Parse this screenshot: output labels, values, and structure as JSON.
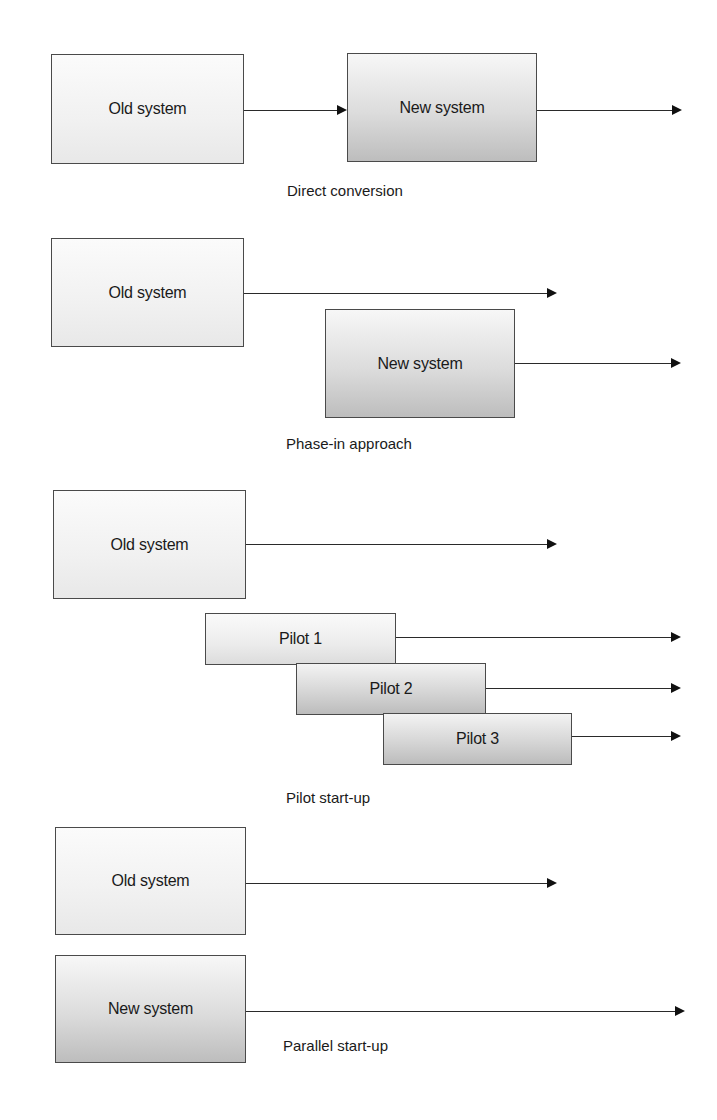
{
  "diagram": {
    "sections": [
      {
        "id": "direct-conversion",
        "caption": "Direct conversion",
        "boxes": [
          {
            "label": "Old system",
            "style": "old"
          },
          {
            "label": "New system",
            "style": "new"
          }
        ]
      },
      {
        "id": "phase-in-approach",
        "caption": "Phase-in approach",
        "boxes": [
          {
            "label": "Old system",
            "style": "old"
          },
          {
            "label": "New system",
            "style": "new"
          }
        ]
      },
      {
        "id": "pilot-start-up",
        "caption": "Pilot start-up",
        "boxes": [
          {
            "label": "Old system",
            "style": "old"
          },
          {
            "label": "Pilot 1",
            "style": "pilot-light"
          },
          {
            "label": "Pilot 2",
            "style": "pilot-dark"
          },
          {
            "label": "Pilot 3",
            "style": "pilot-dark"
          }
        ]
      },
      {
        "id": "parallel-start-up",
        "caption": "Parallel start-up",
        "boxes": [
          {
            "label": "Old system",
            "style": "old"
          },
          {
            "label": "New system",
            "style": "new"
          }
        ]
      }
    ]
  }
}
